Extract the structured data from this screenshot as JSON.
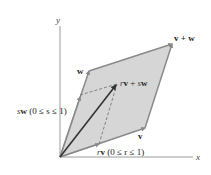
{
  "diagram": {
    "axes": {
      "x_label": "x",
      "y_label": "y"
    },
    "points": {
      "origin": [
        60,
        157
      ],
      "v": [
        145,
        128
      ],
      "w": [
        89,
        71
      ],
      "v_plus_w": [
        172,
        44
      ],
      "rv_plus_sw": [
        117,
        84
      ],
      "sw": [
        80,
        95
      ],
      "rv": [
        99,
        146
      ]
    },
    "labels": {
      "v": "v",
      "w": "w",
      "v_plus_w": "v + w",
      "rv_plus_sw_r": "r",
      "rv_plus_sw_v": "v",
      "rv_plus_sw_plus": " + ",
      "rv_plus_sw_s": "s",
      "rv_plus_sw_w": "w",
      "sw_s": "s",
      "sw_w": "w",
      "sw_range": " (0 ≤ s ≤ 1)",
      "rv_r": "r",
      "rv_v": "v",
      "rv_range": " (0 ≤ r ≤ 1)"
    },
    "colors": {
      "fill": "#d6d6d6",
      "edge": "#8a8a8a",
      "arrow": "#333333",
      "axis": "#9a9a9a",
      "dashed": "#777777"
    }
  }
}
